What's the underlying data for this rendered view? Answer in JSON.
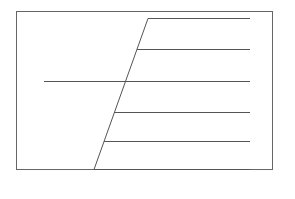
{
  "diagram": {
    "type": "line-drawing",
    "canvas": {
      "width": 295,
      "height": 199,
      "background": "#ffffff"
    },
    "stroke_color": "#555555",
    "frame": {
      "x1": 16,
      "y1": 11,
      "x2": 272,
      "y2": 169,
      "color": "#666666"
    },
    "slanted_edge": {
      "x1": 148,
      "y1": 18,
      "x2": 94,
      "y2": 169
    },
    "long_line": {
      "x1": 44,
      "y1": 81,
      "x2": 250,
      "y2": 81
    },
    "rungs": [
      {
        "x1": 148,
        "y1": 18,
        "x2": 250,
        "y2": 18
      },
      {
        "x1": 137,
        "y1": 49,
        "x2": 250,
        "y2": 49
      },
      {
        "x1": 114,
        "y1": 112,
        "x2": 250,
        "y2": 112
      },
      {
        "x1": 104,
        "y1": 141,
        "x2": 250,
        "y2": 141
      },
      {
        "x1": 94,
        "y1": 169,
        "x2": 250,
        "y2": 169
      }
    ]
  }
}
